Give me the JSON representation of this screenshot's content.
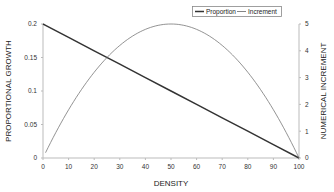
{
  "chart_data": {
    "type": "line",
    "title": "",
    "xlabel": "DENSITY",
    "ylabel": "PROPORTIONAL GROWTH",
    "y2label": "NUMERICAL INCREMENT",
    "xlim": [
      0,
      100
    ],
    "ylim": [
      0,
      0.2
    ],
    "y2lim": [
      0,
      5
    ],
    "xticks": [
      "0",
      "10",
      "20",
      "30",
      "40",
      "50",
      "60",
      "70",
      "80",
      "90",
      "100"
    ],
    "yticks": [
      "0",
      "0.05",
      "0.1",
      "0.15",
      "0.2"
    ],
    "y2ticks": [
      "0",
      "1",
      "2",
      "3",
      "4",
      "5"
    ],
    "grid": false,
    "legend_position": "top-right",
    "x": [
      0,
      1,
      10,
      20,
      30,
      40,
      50,
      60,
      70,
      80,
      90,
      100
    ],
    "series": [
      {
        "name": "Proportion",
        "axis": "left",
        "color": "#333333",
        "values": [
          0.2,
          0.198,
          0.18,
          0.16,
          0.14,
          0.12,
          0.1,
          0.08,
          0.06,
          0.04,
          0.02,
          0.0
        ]
      },
      {
        "name": "Increment",
        "axis": "right",
        "color": "#777777",
        "values": [
          null,
          0.198,
          1.8,
          3.2,
          4.2,
          4.8,
          5.0,
          4.8,
          4.2,
          3.2,
          1.8,
          0.0
        ]
      }
    ]
  },
  "legend": {
    "items": [
      {
        "label": "Proportion"
      },
      {
        "label": "Increment"
      }
    ]
  }
}
